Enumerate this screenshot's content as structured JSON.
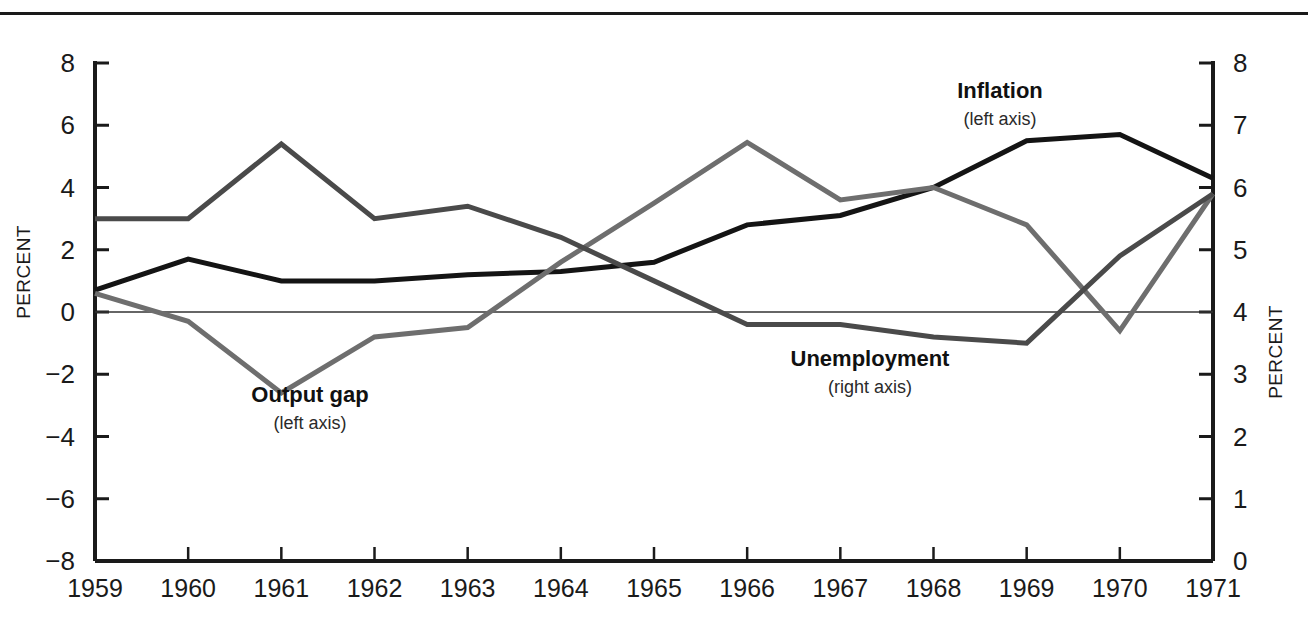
{
  "figure": {
    "background_color": "#ffffff",
    "has_top_rule": true
  },
  "chart_data": {
    "type": "line",
    "title": "",
    "subtitle": "",
    "xlabel": "",
    "ylabel": "PERCENT",
    "ylabel_right": "PERCENT",
    "grid": false,
    "zero_line": true,
    "legend_position": "inline-annotations",
    "categories": [
      "1959",
      "1960",
      "1961",
      "1962",
      "1963",
      "1964",
      "1965",
      "1966",
      "1967",
      "1968",
      "1969",
      "1970",
      "1971"
    ],
    "x": [
      1959,
      1960,
      1961,
      1962,
      1963,
      1964,
      1965,
      1966,
      1967,
      1968,
      1969,
      1970,
      1971
    ],
    "ylim": [
      -8,
      8
    ],
    "ylim_right": [
      0,
      8
    ],
    "yticks": [
      -8,
      -6,
      -4,
      -2,
      0,
      2,
      4,
      6,
      8
    ],
    "yticklabels": [
      "−8",
      "−6",
      "−4",
      "−2",
      "0",
      "2",
      "4",
      "6",
      "8"
    ],
    "yticks_right": [
      0,
      1,
      2,
      3,
      4,
      5,
      6,
      7,
      8
    ],
    "yticklabels_right": [
      "0",
      "1",
      "2",
      "3",
      "4",
      "5",
      "6",
      "7",
      "8"
    ],
    "series": [
      {
        "name": "Inflation",
        "axis": "left",
        "axis_note": "(left axis)",
        "color": "#141414",
        "width": 5,
        "values": [
          0.7,
          1.7,
          1.0,
          1.0,
          1.2,
          1.3,
          1.6,
          2.8,
          3.1,
          4.0,
          5.5,
          5.7,
          4.3
        ]
      },
      {
        "name": "Output gap",
        "axis": "left",
        "axis_note": "(left axis)",
        "color": "#6e6e6e",
        "width": 5,
        "values": [
          0.6,
          -0.3,
          -2.6,
          -0.8,
          -0.5,
          1.6,
          3.5,
          5.45,
          3.6,
          4.0,
          2.8,
          -0.6,
          3.8
        ]
      },
      {
        "name": "Unemployment",
        "axis": "right",
        "axis_note": "(right axis)",
        "color": "#4a4a4a",
        "width": 5,
        "values": [
          5.5,
          5.5,
          6.7,
          5.5,
          5.7,
          5.2,
          4.5,
          3.8,
          3.8,
          3.6,
          3.5,
          4.9,
          5.9
        ]
      }
    ],
    "annotations": [
      {
        "text": "Inflation",
        "sub": "(left axis)",
        "x_px": 1000,
        "y_px": 98
      },
      {
        "text": "Output gap",
        "sub": "(left axis)",
        "x_px": 310,
        "y_px": 402
      },
      {
        "text": "Unemployment",
        "sub": "(right axis)",
        "x_px": 870,
        "y_px": 366
      }
    ]
  }
}
